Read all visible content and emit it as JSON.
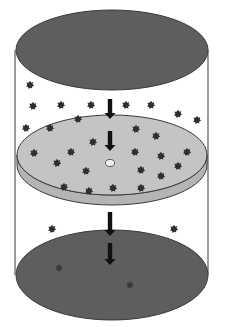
{
  "diagram": {
    "title": "",
    "colors": {
      "background": "#ffffff",
      "cylinder_wall": "#5a5a5a",
      "top_plate": "#5e5e5e",
      "bottom_plate": "#5e5e5e",
      "middle_disc_top": "#c4c4c4",
      "middle_disc_side": "#b4b4b4",
      "outline": "#3a3a3a",
      "particle": "#2f2f2f",
      "particle_on_plate": "#3a3a3a",
      "arrow": "#111111",
      "hole": "#f4f4f4"
    },
    "cylinder": {
      "left_x": 15,
      "right_x": 208
    },
    "top_plate": {
      "cx": 112,
      "cy": 50,
      "rx": 96,
      "ry": 40
    },
    "middle_disc": {
      "cx": 112,
      "cy": 155,
      "rx": 95,
      "ry": 40,
      "thickness": 10,
      "hole": {
        "cx": 110,
        "cy": 163,
        "rx": 4.5,
        "ry": 3.5
      }
    },
    "bottom_plate": {
      "cx": 112,
      "cy": 275,
      "rx": 96,
      "ry": 45
    },
    "arrows": [
      {
        "x": 110,
        "y1": 99,
        "y2": 119
      },
      {
        "x": 110,
        "y1": 131,
        "y2": 151
      },
      {
        "x": 110,
        "y1": 212,
        "y2": 236
      },
      {
        "x": 110,
        "y1": 243,
        "y2": 265
      }
    ],
    "particles_above_disc": [
      [
        30,
        85
      ],
      [
        33,
        106
      ],
      [
        61,
        105
      ],
      [
        91,
        105
      ],
      [
        126,
        105
      ],
      [
        151,
        105
      ],
      [
        178,
        114
      ],
      [
        197,
        120
      ],
      [
        78,
        119
      ],
      [
        26,
        128
      ],
      [
        50,
        128
      ]
    ],
    "particles_on_disc": [
      [
        136,
        129
      ],
      [
        156,
        136
      ],
      [
        93,
        142
      ],
      [
        34,
        153
      ],
      [
        71,
        152
      ],
      [
        135,
        152
      ],
      [
        161,
        156
      ],
      [
        187,
        152
      ],
      [
        57,
        163
      ],
      [
        86,
        171
      ],
      [
        141,
        170
      ],
      [
        178,
        166
      ],
      [
        161,
        176
      ],
      [
        64,
        187
      ],
      [
        89,
        191
      ],
      [
        113,
        188
      ],
      [
        141,
        188
      ]
    ],
    "particles_below_disc": [
      [
        52,
        229
      ],
      [
        174,
        229
      ]
    ],
    "particles_on_bottom_plate": [
      [
        59,
        268
      ],
      [
        130,
        285
      ]
    ]
  }
}
